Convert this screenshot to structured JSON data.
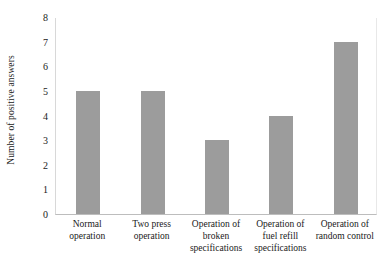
{
  "chart_data": {
    "type": "bar",
    "title": "",
    "xlabel": "",
    "ylabel": "Number of positive answers",
    "categories": [
      "Normal operation",
      "Two press operation",
      "Operation of broken specifications",
      "Operation of fuel refill specifications",
      "Operation of random control"
    ],
    "values": [
      5,
      5,
      3,
      4,
      7
    ],
    "ylim": [
      0,
      8
    ],
    "ytick_labels": [
      "0",
      "1",
      "2",
      "3",
      "4",
      "5",
      "6",
      "7",
      "8"
    ],
    "ytick_values": [
      0,
      1,
      2,
      3,
      4,
      5,
      6,
      7,
      8
    ],
    "grid": false,
    "legend": null,
    "bar_color": "#9c9c9c",
    "axis_color": "#bdbdbd",
    "background_color": "#ffffff"
  }
}
